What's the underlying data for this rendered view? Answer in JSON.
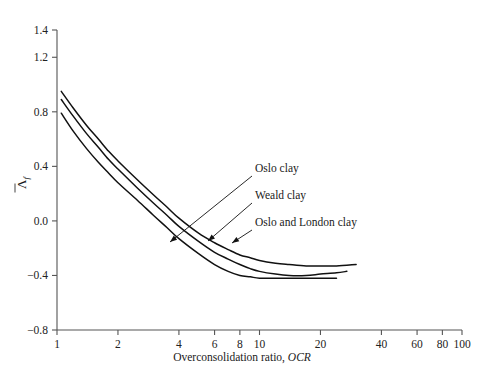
{
  "chart_data": {
    "type": "line",
    "title": "",
    "xlabel": "Overconsolidation ratio, OCR",
    "xlabel_plain": "Overconsolidation ratio,",
    "xlabel_italic": "OCR",
    "ylabel": "Λ̄f",
    "ylabel_symbol": "Λ",
    "ylabel_subscript": "f",
    "xscale": "log",
    "xlim": [
      1,
      100
    ],
    "ylim": [
      -0.8,
      1.4
    ],
    "grid": false,
    "legend_position": "annotations-inline",
    "xticks": [
      1,
      2,
      4,
      6,
      8,
      10,
      20,
      40,
      60,
      80,
      100
    ],
    "xtick_labels": [
      "1",
      "2",
      "4",
      "6",
      "8",
      "10",
      "20",
      "40",
      "60",
      "80",
      "100"
    ],
    "yticks": [
      -0.8,
      -0.4,
      0.0,
      0.4,
      0.8,
      1.2,
      1.4
    ],
    "ytick_labels": [
      "−0.8",
      "−0.4",
      "0.0",
      "0.4",
      "0.8",
      "1.2",
      "1.4"
    ],
    "series": [
      {
        "name": "Oslo clay",
        "points": [
          [
            1.05,
            0.79
          ],
          [
            1.2,
            0.66
          ],
          [
            1.4,
            0.53
          ],
          [
            1.6,
            0.43
          ],
          [
            1.8,
            0.35
          ],
          [
            2.0,
            0.28
          ],
          [
            2.5,
            0.15
          ],
          [
            3.0,
            0.04
          ],
          [
            3.5,
            -0.05
          ],
          [
            4.0,
            -0.13
          ],
          [
            5.0,
            -0.24
          ],
          [
            6.0,
            -0.32
          ],
          [
            7.0,
            -0.37
          ],
          [
            8.0,
            -0.4
          ],
          [
            9.0,
            -0.41
          ],
          [
            10.0,
            -0.42
          ],
          [
            12.0,
            -0.42
          ],
          [
            14.0,
            -0.42
          ],
          [
            17.0,
            -0.42
          ],
          [
            20.0,
            -0.42
          ],
          [
            24.0,
            -0.42
          ]
        ]
      },
      {
        "name": "Weald clay",
        "points": [
          [
            1.05,
            0.89
          ],
          [
            1.2,
            0.77
          ],
          [
            1.4,
            0.64
          ],
          [
            1.6,
            0.54
          ],
          [
            1.8,
            0.45
          ],
          [
            2.0,
            0.38
          ],
          [
            2.5,
            0.24
          ],
          [
            3.0,
            0.13
          ],
          [
            3.5,
            0.04
          ],
          [
            4.0,
            -0.04
          ],
          [
            5.0,
            -0.15
          ],
          [
            6.0,
            -0.23
          ],
          [
            7.0,
            -0.28
          ],
          [
            8.0,
            -0.32
          ],
          [
            9.0,
            -0.35
          ],
          [
            10.0,
            -0.37
          ],
          [
            12.0,
            -0.39
          ],
          [
            14.0,
            -0.4
          ],
          [
            17.0,
            -0.4
          ],
          [
            20.0,
            -0.39
          ],
          [
            24.0,
            -0.38
          ],
          [
            27.0,
            -0.37
          ]
        ]
      },
      {
        "name": "Oslo and London clay",
        "points": [
          [
            1.05,
            0.95
          ],
          [
            1.2,
            0.83
          ],
          [
            1.4,
            0.7
          ],
          [
            1.6,
            0.6
          ],
          [
            1.8,
            0.51
          ],
          [
            2.0,
            0.44
          ],
          [
            2.5,
            0.3
          ],
          [
            3.0,
            0.19
          ],
          [
            3.5,
            0.1
          ],
          [
            4.0,
            0.02
          ],
          [
            5.0,
            -0.09
          ],
          [
            6.0,
            -0.16
          ],
          [
            7.0,
            -0.21
          ],
          [
            8.0,
            -0.25
          ],
          [
            9.0,
            -0.27
          ],
          [
            10.0,
            -0.29
          ],
          [
            12.0,
            -0.31
          ],
          [
            14.0,
            -0.32
          ],
          [
            17.0,
            -0.33
          ],
          [
            20.0,
            -0.33
          ],
          [
            24.0,
            -0.33
          ],
          [
            30.0,
            -0.32
          ]
        ]
      }
    ],
    "annotations": [
      {
        "text": "Oslo clay",
        "label_x": 255,
        "label_y": 172,
        "leader_from_x": 252,
        "leader_from_y": 176,
        "leader_to_x": 170,
        "leader_to_y": 242
      },
      {
        "text": "Weald clay",
        "label_x": 255,
        "label_y": 199,
        "leader_from_x": 252,
        "leader_from_y": 203,
        "leader_to_x": 208,
        "leader_to_y": 241
      },
      {
        "text": "Oslo and London clay",
        "label_x": 255,
        "label_y": 226,
        "leader_from_x": 252,
        "leader_from_y": 230,
        "leader_to_x": 232,
        "leader_to_y": 243
      }
    ]
  }
}
